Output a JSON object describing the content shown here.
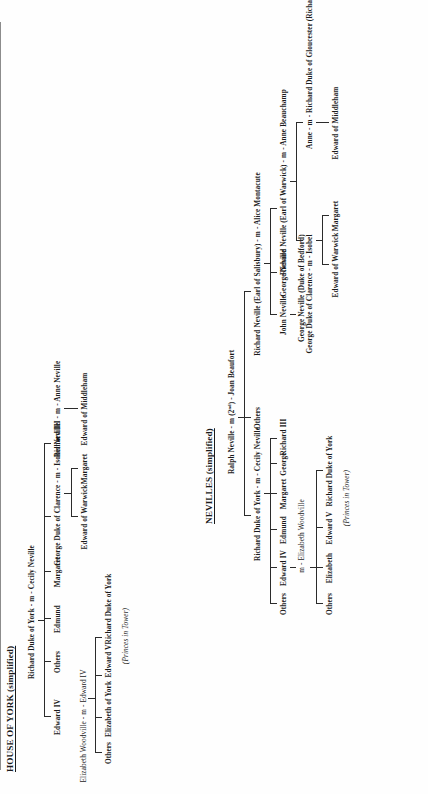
{
  "document": {
    "orientation": "rotated-90-ccw",
    "background": "#ffffff",
    "ink": "#1b1b1b",
    "divider_color": "#8c8c8c"
  },
  "york": {
    "title": "HOUSE OF YORK (simplified)",
    "root": "Richard Duke of York  -  m  -  Cecily Neville",
    "children": [
      {
        "label": "Edward IV"
      },
      {
        "label": "Others"
      },
      {
        "label": "Edmund"
      },
      {
        "label": "Margaret"
      },
      {
        "label": "George Duke of Clarence  -  m  -  Isobel Neville"
      },
      {
        "label": "Richard III  -  m  -  Anne Neville"
      }
    ],
    "edward_iv_marriage": "Elizabeth Woodville  -  m  -  Edward IV",
    "edward_iv_children": [
      {
        "label": "Others"
      },
      {
        "label": "Elizabeth of York"
      },
      {
        "label": "Edward V"
      },
      {
        "label": "Richard Duke of York"
      }
    ],
    "princes_note": "(Princes in Tower)",
    "clarence_children": [
      {
        "label": "Edward of Warwick"
      },
      {
        "label": "Margaret"
      }
    ],
    "richard_iii_children": [
      {
        "label": "Edward of Middleham"
      }
    ]
  },
  "nevilles": {
    "title": "NEVILLES (simplified)",
    "root": "Ralph Neville  -  m (2ⁿᵈ)  -  Joan Beaufort",
    "root_display": "Ralph Neville  -  m (2",
    "root_sup": "nd",
    "root_tail": ")  -  Joan Beaufort",
    "children": [
      {
        "label": "Richard Duke of York  -  m  -  Cecily Neville"
      },
      {
        "label": "Others"
      },
      {
        "label": "Richard Neville (Earl of Salisbury)  -  m  -  Alice Montacute"
      }
    ],
    "salisbury_children": [
      {
        "label": "John Neville"
      },
      {
        "label": "George Neville"
      },
      {
        "label": "Richard Neville (Earl of Warwick)  -  m  -  Anne Beauchamp"
      }
    ],
    "george_neville_title": "George Neville (Duke of Bedford)",
    "warwick_children": [
      {
        "label": "Isobel"
      },
      {
        "label": "Anne"
      }
    ],
    "isobel_marriage": "George Duke of Clarence  -  m  -  Isobel",
    "anne_marriage": "Anne  -  m  -  Richard Duke of Gloucester (Richard III)",
    "isobel_children": [
      {
        "label": "Edward of Warwick"
      },
      {
        "label": "Margaret"
      }
    ],
    "anne_children": [
      {
        "label": "Edward of Middleham"
      }
    ],
    "york_children": [
      {
        "label": "Others"
      },
      {
        "label": "Edward IV"
      },
      {
        "label": "Edmund"
      },
      {
        "label": "Margaret"
      },
      {
        "label": "George"
      },
      {
        "label": "Richard III"
      }
    ],
    "edward_iv_marriage": "m  -  Elizabeth Woodville",
    "edward_iv_children": [
      {
        "label": "Others"
      },
      {
        "label": "Elizabeth"
      },
      {
        "label": "Edward V"
      },
      {
        "label": "Richard Duke of York"
      }
    ],
    "princes_note": "(Princes in Tower)"
  }
}
